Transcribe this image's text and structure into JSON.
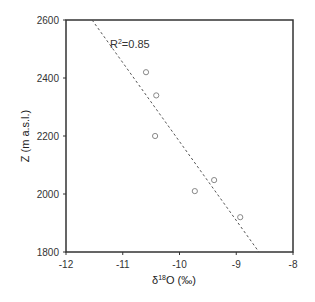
{
  "chart_data": {
    "type": "scatter",
    "title": "",
    "xlabel": "δ18O (‰)",
    "ylabel": "Z (m a.s.l.)",
    "xlim": [
      -12,
      -8
    ],
    "ylim": [
      1800,
      2600
    ],
    "xticks": [
      -12,
      -11,
      -10,
      -9,
      -8
    ],
    "yticks": [
      1800,
      2000,
      2200,
      2400,
      2600
    ],
    "xtick_labels": [
      "-12",
      "-11",
      "-10",
      "-9",
      "-8"
    ],
    "ytick_labels": [
      "1800",
      "2000",
      "2200",
      "2400",
      "2600"
    ],
    "grid": false,
    "legend": null,
    "series": [
      {
        "name": "samples",
        "marker": "open-circle",
        "points": [
          {
            "x": -10.59,
            "y": 2420
          },
          {
            "x": -10.41,
            "y": 2340
          },
          {
            "x": -10.43,
            "y": 2200
          },
          {
            "x": -9.73,
            "y": 2010
          },
          {
            "x": -9.39,
            "y": 2048
          },
          {
            "x": -8.93,
            "y": 1920
          }
        ]
      },
      {
        "name": "linear fit",
        "style": "dashed",
        "points": [
          {
            "x": -11.54,
            "y": 2600
          },
          {
            "x": -8.6,
            "y": 1800
          }
        ]
      }
    ],
    "annotations": [
      {
        "text": "R²=0.85",
        "x": -11.0,
        "y": 2550
      }
    ]
  },
  "labels": {
    "xlabel_delta": "δ",
    "xlabel_sup": "18",
    "xlabel_rest": "O (‰)",
    "ylabel": "Z (m a.s.l.)",
    "r2_prefix": "R",
    "r2_sup": "2",
    "r2_rest": "=0.85"
  },
  "colors": {
    "axis": "#333333",
    "marker": "#888888",
    "fit_line": "#555555"
  }
}
